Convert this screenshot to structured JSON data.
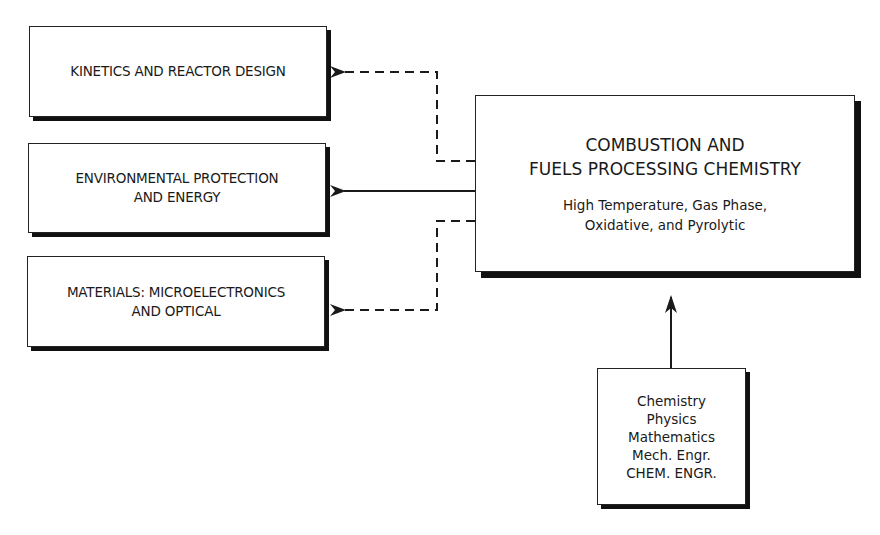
{
  "diagram": {
    "central": {
      "title": "COMBUSTION AND\nFUELS PROCESSING CHEMISTRY",
      "subtitle": "High Temperature, Gas Phase,\nOxidative, and Pyrolytic"
    },
    "applications": [
      {
        "label": "KINETICS AND REACTOR DESIGN",
        "link": "dashed"
      },
      {
        "label": "ENVIRONMENTAL PROTECTION\nAND ENERGY",
        "link": "solid"
      },
      {
        "label": "MATERIALS: MICROELECTRONICS\nAND OPTICAL",
        "link": "dashed"
      }
    ],
    "foundations": {
      "disciplines": [
        "Chemistry",
        "Physics",
        "Mathematics",
        "Mech. Engr.",
        "CHEM. ENGR."
      ]
    },
    "colors": {
      "line": "#1a1a1a",
      "shadow": "#111111",
      "background": "#ffffff"
    }
  }
}
